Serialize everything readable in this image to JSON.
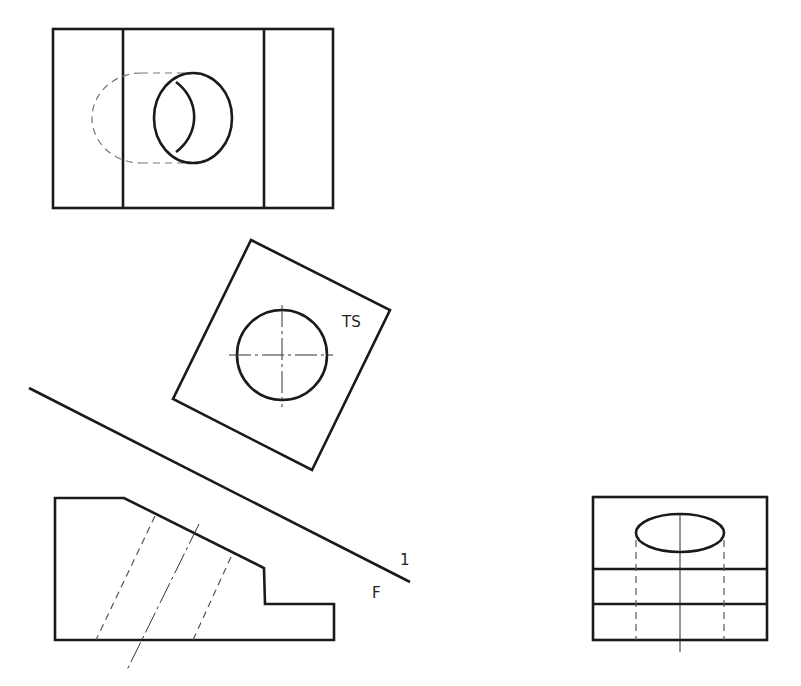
{
  "diagram": {
    "type": "orthographic-projection-with-auxiliary-view",
    "views": {
      "top": {
        "label": ""
      },
      "auxiliary": {
        "label": "TS"
      },
      "front": {
        "label": ""
      },
      "side": {
        "label": ""
      }
    },
    "fold_line": {
      "label_above": "1",
      "label_below": "F"
    }
  }
}
